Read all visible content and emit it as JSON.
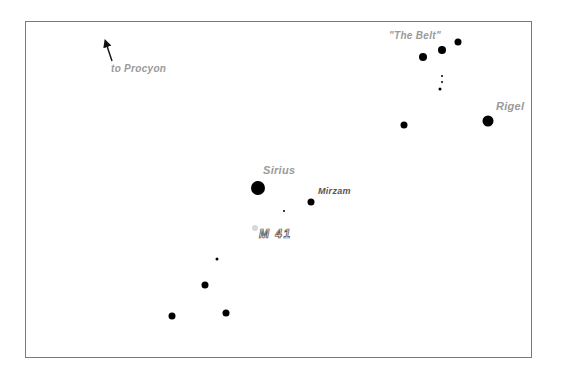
{
  "chart": {
    "title": "",
    "frame_color": "#7a7a7a",
    "star_color": "#000000",
    "label_color": "#9a9a9a",
    "cluster_color": "#d8d8d8"
  },
  "labels": {
    "procyon": "to  Procyon",
    "belt": "\"The  Belt\"",
    "rigel": "Rigel",
    "sirius": "Sirius",
    "mirzam": "Mirzam",
    "m41": "M  41"
  },
  "stars": [
    {
      "name": "belt-star-1",
      "x": 423,
      "y": 57,
      "size": 8
    },
    {
      "name": "belt-star-2",
      "x": 442,
      "y": 50,
      "size": 8
    },
    {
      "name": "belt-star-3",
      "x": 458,
      "y": 42,
      "size": 7
    },
    {
      "name": "sword-star-1",
      "x": 442,
      "y": 76,
      "size": 2
    },
    {
      "name": "sword-star-2",
      "x": 442,
      "y": 82,
      "size": 2
    },
    {
      "name": "sword-star-3",
      "x": 440,
      "y": 89,
      "size": 3
    },
    {
      "name": "saiph",
      "x": 404,
      "y": 125,
      "size": 7
    },
    {
      "name": "rigel",
      "x": 488,
      "y": 121,
      "size": 11
    },
    {
      "name": "sirius",
      "x": 258,
      "y": 188,
      "size": 14
    },
    {
      "name": "mirzam",
      "x": 311,
      "y": 202,
      "size": 7
    },
    {
      "name": "faint-star",
      "x": 284,
      "y": 211,
      "size": 2
    },
    {
      "name": "cma-star-1",
      "x": 217,
      "y": 259,
      "size": 3
    },
    {
      "name": "cma-star-2",
      "x": 205,
      "y": 285,
      "size": 7
    },
    {
      "name": "cma-star-3",
      "x": 226,
      "y": 313,
      "size": 7
    },
    {
      "name": "cma-star-4",
      "x": 172,
      "y": 316,
      "size": 7
    }
  ],
  "clusters": [
    {
      "name": "m41",
      "x": 255,
      "y": 228,
      "size": 6
    }
  ]
}
